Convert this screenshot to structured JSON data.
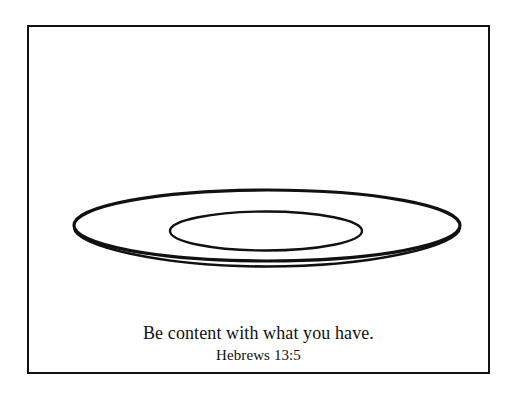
{
  "page": {
    "background_color": "#ffffff",
    "width": 515,
    "height": 393
  },
  "frame": {
    "name": "page-border",
    "stroke_color": "#111111",
    "stroke_width": 2
  },
  "illustration": {
    "name": "plate-line-drawing",
    "subject": "plate",
    "style": "black outline coloring page",
    "stroke_color": "#111111",
    "fill_color": "#ffffff",
    "shapes": [
      {
        "name": "plate-outer-rim",
        "type": "ellipse",
        "cx": 267,
        "cy": 225.5,
        "rx": 193,
        "ry": 35.5,
        "stroke_width": 3.2
      },
      {
        "name": "plate-edge-depth",
        "type": "arc",
        "description": "lower arc offset below the rim giving the plate thickness",
        "offset_y": 5,
        "stroke_width": 2.6
      },
      {
        "name": "plate-inner-well",
        "type": "ellipse",
        "cx": 266,
        "cy": 231,
        "rx": 96,
        "ry": 19.5,
        "stroke_width": 2.4
      }
    ]
  },
  "caption": {
    "name": "scripture-caption",
    "text_color": "#111111",
    "verse_text": "Be content with what you have.",
    "verse_reference": "Hebrews 13:5"
  }
}
